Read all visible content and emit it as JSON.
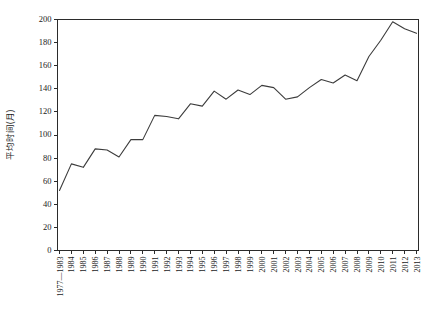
{
  "chart_data": {
    "type": "line",
    "title": "",
    "xlabel": "",
    "ylabel": "平均时间(月)",
    "ylim": [
      0,
      200
    ],
    "ytick_values": [
      0,
      20,
      40,
      60,
      80,
      100,
      120,
      140,
      160,
      180,
      200
    ],
    "ytick_labels": [
      "0",
      "20",
      "40",
      "60",
      "80",
      "100",
      "120",
      "140",
      "160",
      "180",
      "200"
    ],
    "grid": false,
    "legend": "none",
    "categories": [
      "1977—1983",
      "1984",
      "1985",
      "1986",
      "1987",
      "1988",
      "1989",
      "1990",
      "1991",
      "1992",
      "1993",
      "1994",
      "1995",
      "1996",
      "1997",
      "1998",
      "1999",
      "2000",
      "2001",
      "2002",
      "2003",
      "2004",
      "2005",
      "2006",
      "2007",
      "2008",
      "2009",
      "2010",
      "2011",
      "2012",
      "2013"
    ],
    "values": [
      52,
      75,
      72,
      88,
      87,
      81,
      96,
      96,
      117,
      116,
      114,
      127,
      125,
      138,
      131,
      139,
      135,
      143,
      141,
      131,
      133,
      141,
      148,
      145,
      152,
      147,
      168,
      182,
      198,
      192,
      188
    ],
    "series": [
      {
        "name": "平均时间(月)",
        "values": [
          52,
          75,
          72,
          88,
          87,
          81,
          96,
          96,
          117,
          116,
          114,
          127,
          125,
          138,
          131,
          139,
          135,
          143,
          141,
          131,
          133,
          141,
          148,
          145,
          152,
          147,
          168,
          182,
          198,
          192,
          188
        ],
        "color": "#3c3c3c"
      }
    ]
  },
  "axes": {
    "y_axis_name": "y-axis",
    "x_axis_name": "x-axis"
  }
}
